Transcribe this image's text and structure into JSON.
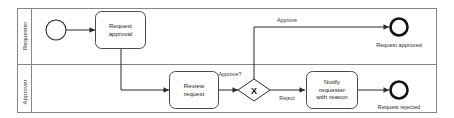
{
  "diagram": {
    "type": "bpmn-process",
    "colors": {
      "pool_stroke": "#868686",
      "shape_stroke": "#2a2a2a",
      "task_stroke": "#4a4a4a",
      "end_event_stroke": "#111111",
      "text": "#1f1f1f",
      "background": "#ffffff"
    },
    "lanes": [
      {
        "id": "lane-requester",
        "label": "Requester"
      },
      {
        "id": "lane-approver",
        "label": "Approver"
      }
    ],
    "nodes": [
      {
        "id": "start-event",
        "kind": "start-event",
        "lane": "lane-requester",
        "label": ""
      },
      {
        "id": "task-request-approval",
        "kind": "task",
        "lane": "lane-requester",
        "label": "Request approval",
        "lines": [
          "Request",
          "approval"
        ]
      },
      {
        "id": "task-review-request",
        "kind": "task",
        "lane": "lane-approver",
        "label": "Review request",
        "lines": [
          "Review",
          "request"
        ]
      },
      {
        "id": "gateway-approve",
        "kind": "exclusive-gateway",
        "lane": "lane-approver",
        "label": "Approve?",
        "marker": "X"
      },
      {
        "id": "task-notify-requester",
        "kind": "task",
        "lane": "lane-approver",
        "label": "Notify requester with reason",
        "lines": [
          "Notify",
          "requester",
          "with reason"
        ]
      },
      {
        "id": "end-approved",
        "kind": "end-event",
        "lane": "lane-requester",
        "label": "Request approved"
      },
      {
        "id": "end-rejected",
        "kind": "end-event",
        "lane": "lane-approver",
        "label": "Request rejected"
      }
    ],
    "flows": [
      {
        "id": "flow-start-to-request",
        "from": "start-event",
        "to": "task-request-approval",
        "label": ""
      },
      {
        "id": "flow-request-to-review",
        "from": "task-request-approval",
        "to": "task-review-request",
        "label": ""
      },
      {
        "id": "flow-review-to-gateway",
        "from": "task-review-request",
        "to": "gateway-approve",
        "label": ""
      },
      {
        "id": "flow-gateway-approve",
        "from": "gateway-approve",
        "to": "end-approved",
        "label": "Approve"
      },
      {
        "id": "flow-gateway-reject",
        "from": "gateway-approve",
        "to": "task-notify-requester",
        "label": "Reject"
      },
      {
        "id": "flow-notify-to-end",
        "from": "task-notify-requester",
        "to": "end-rejected",
        "label": ""
      }
    ]
  }
}
